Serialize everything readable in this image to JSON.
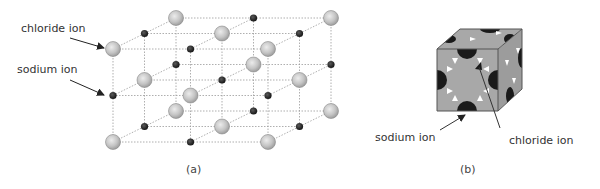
{
  "figure": {
    "panel_a": {
      "caption": "(a)",
      "title": "NaCl crystal lattice (ball model)",
      "labels": {
        "chloride": "chloride ion",
        "sodium": "sodium ion"
      },
      "legend": {
        "chloride_ion": {
          "appearance": "large light-grey sphere",
          "color": "#c8c8c8"
        },
        "sodium_ion": {
          "appearance": "small black sphere",
          "color": "#222222"
        }
      },
      "lattice": {
        "nx": 3,
        "ny": 3,
        "nz": 3
      }
    },
    "panel_b": {
      "caption": "(b)",
      "title": "NaCl unit cell (space-filling model)",
      "labels": {
        "sodium": "sodium ion",
        "chloride": "chloride ion"
      },
      "colors": {
        "chloride_face": "#a6a6a6",
        "sodium": "#1a1a1a",
        "gap": "#ffffff"
      }
    }
  }
}
